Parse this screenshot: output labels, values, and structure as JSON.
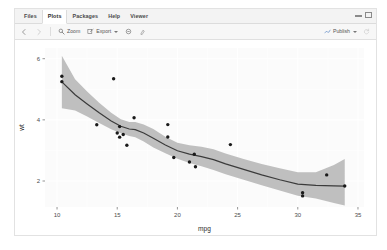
{
  "window": {
    "minimize_icon": "window-minimize-icon",
    "maximize_icon": "window-maximize-icon"
  },
  "tabs": [
    {
      "label": "Files",
      "active": false
    },
    {
      "label": "Plots",
      "active": true
    },
    {
      "label": "Packages",
      "active": false
    },
    {
      "label": "Help",
      "active": false
    },
    {
      "label": "Viewer",
      "active": false
    }
  ],
  "toolbar": {
    "back_icon": "back-arrow-icon",
    "forward_icon": "forward-arrow-icon",
    "zoom_icon": "magnifier-icon",
    "zoom_label": "Zoom",
    "export_icon": "export-icon",
    "export_label": "Export",
    "remove_icon": "remove-plot-icon",
    "clear_icon": "clear-all-plots-icon",
    "publish_icon": "publish-icon",
    "publish_label": "Publish",
    "refresh_icon": "refresh-icon"
  },
  "chart_data": {
    "type": "scatter",
    "title": "",
    "xlabel": "mpg",
    "ylabel": "wt",
    "xlim": [
      9.0,
      35.5
    ],
    "ylim": [
      1.15,
      6.35
    ],
    "xticks": [
      10,
      15,
      20,
      25,
      30,
      35
    ],
    "yticks": [
      2,
      4,
      6
    ],
    "grid": true,
    "panel_background": "#fbfbfb",
    "point_color": "#1a1a1a",
    "line_color": "#3b3b3b",
    "ribbon_color": "#bfbfbf",
    "points": [
      {
        "x": 10.4,
        "y": 5.25
      },
      {
        "x": 10.4,
        "y": 5.424
      },
      {
        "x": 14.7,
        "y": 5.345
      },
      {
        "x": 13.3,
        "y": 3.84
      },
      {
        "x": 15.2,
        "y": 3.78
      },
      {
        "x": 15.0,
        "y": 3.57
      },
      {
        "x": 15.2,
        "y": 3.435
      },
      {
        "x": 15.5,
        "y": 3.52
      },
      {
        "x": 16.4,
        "y": 4.07
      },
      {
        "x": 15.8,
        "y": 3.17
      },
      {
        "x": 19.2,
        "y": 3.845
      },
      {
        "x": 19.2,
        "y": 3.44
      },
      {
        "x": 24.4,
        "y": 3.19
      },
      {
        "x": 19.7,
        "y": 2.77
      },
      {
        "x": 21.0,
        "y": 2.62
      },
      {
        "x": 21.4,
        "y": 2.875
      },
      {
        "x": 21.5,
        "y": 2.465
      },
      {
        "x": 30.4,
        "y": 1.615
      },
      {
        "x": 30.4,
        "y": 1.513
      },
      {
        "x": 32.4,
        "y": 2.2
      },
      {
        "x": 33.9,
        "y": 1.835
      }
    ],
    "smooth_line": [
      {
        "x": 10.4,
        "y": 5.24
      },
      {
        "x": 11.5,
        "y": 4.82
      },
      {
        "x": 12.5,
        "y": 4.52
      },
      {
        "x": 13.5,
        "y": 4.23
      },
      {
        "x": 14.5,
        "y": 3.96
      },
      {
        "x": 15.3,
        "y": 3.79
      },
      {
        "x": 16.0,
        "y": 3.7
      },
      {
        "x": 16.5,
        "y": 3.68
      },
      {
        "x": 17.2,
        "y": 3.57
      },
      {
        "x": 18.0,
        "y": 3.4
      },
      {
        "x": 19.0,
        "y": 3.18
      },
      {
        "x": 20.0,
        "y": 2.99
      },
      {
        "x": 21.0,
        "y": 2.88
      },
      {
        "x": 22.0,
        "y": 2.8
      },
      {
        "x": 23.0,
        "y": 2.7
      },
      {
        "x": 24.0,
        "y": 2.56
      },
      {
        "x": 25.5,
        "y": 2.38
      },
      {
        "x": 27.0,
        "y": 2.2
      },
      {
        "x": 28.5,
        "y": 2.04
      },
      {
        "x": 30.0,
        "y": 1.9
      },
      {
        "x": 31.5,
        "y": 1.86
      },
      {
        "x": 33.0,
        "y": 1.84
      },
      {
        "x": 33.9,
        "y": 1.83
      }
    ],
    "ribbon_upper": [
      {
        "x": 10.4,
        "y": 6.1
      },
      {
        "x": 11.5,
        "y": 5.33
      },
      {
        "x": 12.5,
        "y": 4.93
      },
      {
        "x": 13.5,
        "y": 4.56
      },
      {
        "x": 14.5,
        "y": 4.23
      },
      {
        "x": 15.3,
        "y": 4.02
      },
      {
        "x": 16.0,
        "y": 3.93
      },
      {
        "x": 16.5,
        "y": 3.93
      },
      {
        "x": 17.2,
        "y": 3.85
      },
      {
        "x": 18.0,
        "y": 3.7
      },
      {
        "x": 19.0,
        "y": 3.45
      },
      {
        "x": 20.0,
        "y": 3.25
      },
      {
        "x": 21.0,
        "y": 3.17
      },
      {
        "x": 22.0,
        "y": 3.12
      },
      {
        "x": 23.0,
        "y": 3.04
      },
      {
        "x": 24.0,
        "y": 2.9
      },
      {
        "x": 25.5,
        "y": 2.72
      },
      {
        "x": 27.0,
        "y": 2.56
      },
      {
        "x": 28.5,
        "y": 2.42
      },
      {
        "x": 30.0,
        "y": 2.29
      },
      {
        "x": 31.5,
        "y": 2.29
      },
      {
        "x": 33.0,
        "y": 2.52
      },
      {
        "x": 33.9,
        "y": 2.72
      }
    ],
    "ribbon_lower": [
      {
        "x": 10.4,
        "y": 4.38
      },
      {
        "x": 11.5,
        "y": 4.31
      },
      {
        "x": 12.5,
        "y": 4.11
      },
      {
        "x": 13.5,
        "y": 3.9
      },
      {
        "x": 14.5,
        "y": 3.69
      },
      {
        "x": 15.3,
        "y": 3.56
      },
      {
        "x": 16.0,
        "y": 3.47
      },
      {
        "x": 16.5,
        "y": 3.43
      },
      {
        "x": 17.2,
        "y": 3.29
      },
      {
        "x": 18.0,
        "y": 3.1
      },
      {
        "x": 19.0,
        "y": 2.91
      },
      {
        "x": 20.0,
        "y": 2.73
      },
      {
        "x": 21.0,
        "y": 2.59
      },
      {
        "x": 22.0,
        "y": 2.48
      },
      {
        "x": 23.0,
        "y": 2.36
      },
      {
        "x": 24.0,
        "y": 2.22
      },
      {
        "x": 25.5,
        "y": 2.04
      },
      {
        "x": 27.0,
        "y": 1.86
      },
      {
        "x": 28.5,
        "y": 1.69
      },
      {
        "x": 30.0,
        "y": 1.52
      },
      {
        "x": 31.5,
        "y": 1.43
      },
      {
        "x": 33.0,
        "y": 1.28
      },
      {
        "x": 33.9,
        "y": 1.2
      }
    ]
  }
}
